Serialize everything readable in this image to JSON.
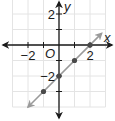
{
  "chart_data": {
    "type": "line",
    "title": "",
    "xlabel": "x",
    "ylabel": "y",
    "origin_label": "O",
    "xlim": [
      -3,
      3
    ],
    "ylim": [
      -4,
      3
    ],
    "grid": true,
    "x_tick_labels": [
      {
        "value": -2,
        "label": "−2"
      },
      {
        "value": 2,
        "label": "2"
      }
    ],
    "y_tick_labels": [
      {
        "value": 2,
        "label": "2"
      },
      {
        "value": -2,
        "label": "−2"
      }
    ],
    "x_ticks": [
      -2,
      -1,
      1,
      2
    ],
    "y_ticks": [
      2,
      1,
      -1,
      -2,
      -3
    ],
    "series": [
      {
        "name": "y = x - 2",
        "line_color": "#9a9a9a",
        "point_color": "#4a4a4a",
        "line_extent": {
          "from": [
            -2,
            -4
          ],
          "to": [
            2.75,
            0.75
          ]
        },
        "points": [
          {
            "x": 2,
            "y": 0
          },
          {
            "x": 1,
            "y": -1
          },
          {
            "x": 0,
            "y": -2
          },
          {
            "x": -1,
            "y": -3
          }
        ]
      }
    ]
  },
  "layout": {
    "origin_px": [
      59,
      45
    ],
    "unit_px": 15.5,
    "axis_color": "#1a1a1a",
    "grid_color": "#e4e4e4"
  }
}
